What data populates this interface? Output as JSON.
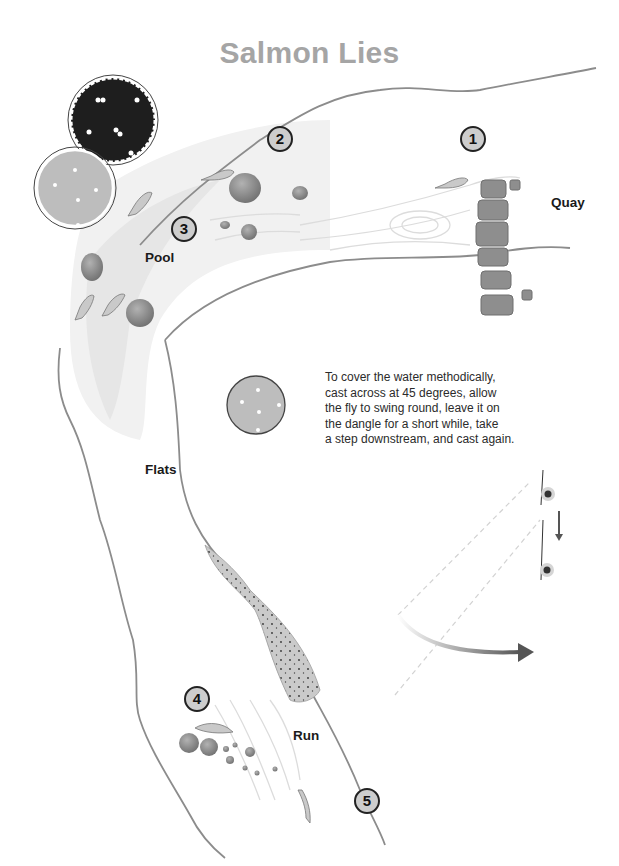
{
  "title": "Salmon Lies",
  "labels": {
    "quay": "Quay",
    "pool": "Pool",
    "flats": "Flats",
    "run": "Run"
  },
  "markers": [
    {
      "number": "1",
      "x": 460,
      "y": 126
    },
    {
      "number": "2",
      "x": 267,
      "y": 126
    },
    {
      "number": "3",
      "x": 171,
      "y": 216
    },
    {
      "number": "4",
      "x": 184,
      "y": 686
    },
    {
      "number": "5",
      "x": 354,
      "y": 788
    }
  ],
  "instruction": {
    "lines": [
      "To cover the water methodically,",
      "cast across at 45 degrees, allow",
      "the fly to swing round, leave it on",
      "the dangle for a short while, take",
      "a step downstream, and cast again."
    ]
  },
  "icons": {
    "fish": "salmon-fish-icon",
    "rock": "rock-icon",
    "tree": "tree-icon",
    "angler": "angler-icon",
    "swing_arrow": "curved-arrow-icon",
    "step_arrow": "down-arrow-icon"
  },
  "colors": {
    "title": "#a5a5a5",
    "bank": "#8c8c8c",
    "pool_shade": "#efefef",
    "rock": "#8a8a8a",
    "tree_dark": "#1e1e1e",
    "tree_light": "#bdbdbd",
    "gravel": "#c9c9c9",
    "marker_fill": "#cdcdcd"
  }
}
